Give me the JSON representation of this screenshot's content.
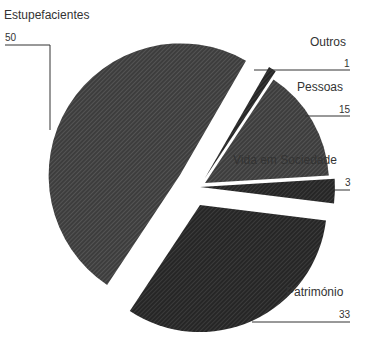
{
  "chart_data": {
    "type": "pie",
    "title": "",
    "exploded": true,
    "categories": [
      "Outros",
      "Pessoas",
      "Vida em Sociedade",
      "Património",
      "Estupefacientes"
    ],
    "values": [
      1,
      15,
      3,
      33,
      50
    ],
    "colors": [
      "#2e2e2e",
      "#4a4a4a",
      "#2e2e2e",
      "#333333",
      "#4d4d4d"
    ],
    "legend": "none",
    "labels": {
      "outros": {
        "name": "Outros",
        "value": "1"
      },
      "pessoas": {
        "name": "Pessoas",
        "value": "15"
      },
      "vida": {
        "name": "Vida em Sociedade",
        "value": "3"
      },
      "patrimonio": {
        "name": "Património",
        "value": "33"
      },
      "estupefacientes": {
        "name": "Estupefacientes",
        "value": "50"
      }
    }
  }
}
